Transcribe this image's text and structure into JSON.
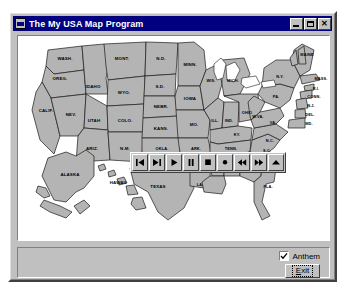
{
  "window": {
    "title": "The My USA Map Program",
    "icon": "application-window-icon",
    "controls": [
      {
        "name": "minimize",
        "glyph": "_"
      },
      {
        "name": "maximize",
        "glyph": "□"
      },
      {
        "name": "close",
        "glyph": "✕"
      }
    ]
  },
  "map": {
    "name": "usa-map",
    "states": [
      {
        "abbr": "WASH.",
        "x": 47,
        "y": 24
      },
      {
        "abbr": "OREG.",
        "x": 42,
        "y": 42
      },
      {
        "abbr": "CALIF.",
        "x": 30,
        "y": 75
      },
      {
        "abbr": "NEV.",
        "x": 53,
        "y": 72
      },
      {
        "abbr": "IDAHO",
        "x": 70,
        "y": 42
      },
      {
        "abbr": "MONT.",
        "x": 100,
        "y": 27
      },
      {
        "abbr": "WYO.",
        "x": 100,
        "y": 56
      },
      {
        "abbr": "UTAH",
        "x": 75,
        "y": 78
      },
      {
        "abbr": "COLO.",
        "x": 108,
        "y": 82
      },
      {
        "abbr": "ARIZ.",
        "x": 72,
        "y": 108
      },
      {
        "abbr": "N.M.",
        "x": 104,
        "y": 112
      },
      {
        "abbr": "N.D.",
        "x": 137,
        "y": 27
      },
      {
        "abbr": "S.D.",
        "x": 137,
        "y": 48
      },
      {
        "abbr": "NEBR.",
        "x": 140,
        "y": 70
      },
      {
        "abbr": "KANS.",
        "x": 146,
        "y": 92
      },
      {
        "abbr": "OKLA.",
        "x": 146,
        "y": 113
      },
      {
        "abbr": "TEXAS",
        "x": 137,
        "y": 150
      },
      {
        "abbr": "MINN.",
        "x": 168,
        "y": 32
      },
      {
        "abbr": "IOWA",
        "x": 170,
        "y": 63
      },
      {
        "abbr": "MO.",
        "x": 180,
        "y": 88
      },
      {
        "abbr": "ARK.",
        "x": 178,
        "y": 115
      },
      {
        "abbr": "LA.",
        "x": 180,
        "y": 140
      },
      {
        "abbr": "WIS.",
        "x": 190,
        "y": 43
      },
      {
        "abbr": "ILL.",
        "x": 196,
        "y": 77
      },
      {
        "abbr": "MICH.",
        "x": 214,
        "y": 45
      },
      {
        "abbr": "IND.",
        "x": 212,
        "y": 77
      },
      {
        "abbr": "OHIO",
        "x": 231,
        "y": 72
      },
      {
        "abbr": "KY.",
        "x": 223,
        "y": 94
      },
      {
        "abbr": "TENN.",
        "x": 215,
        "y": 108
      },
      {
        "abbr": "MISS.",
        "x": 197,
        "y": 129
      },
      {
        "abbr": "ALA.",
        "x": 213,
        "y": 129
      },
      {
        "abbr": "GA.",
        "x": 236,
        "y": 131
      },
      {
        "abbr": "FLA.",
        "x": 251,
        "y": 159
      },
      {
        "abbr": "S.C.",
        "x": 250,
        "y": 117
      },
      {
        "abbr": "N.C.",
        "x": 255,
        "y": 104
      },
      {
        "abbr": "VA.",
        "x": 256,
        "y": 87
      },
      {
        "abbr": "W.VA.",
        "x": 242,
        "y": 83
      },
      {
        "abbr": "PA.",
        "x": 258,
        "y": 60
      },
      {
        "abbr": "N.Y.",
        "x": 265,
        "y": 42
      },
      {
        "abbr": "MAINE",
        "x": 292,
        "y": 18
      },
      {
        "abbr": "VT.",
        "x": 277,
        "y": 29
      },
      {
        "abbr": "N.H.",
        "x": 284,
        "y": 32
      },
      {
        "abbr": "MASS.",
        "x": 296,
        "y": 44
      },
      {
        "abbr": "R.I.",
        "x": 295,
        "y": 54
      },
      {
        "abbr": "CONN.",
        "x": 292,
        "y": 62
      },
      {
        "abbr": "N.J.",
        "x": 292,
        "y": 70
      },
      {
        "abbr": "DEL.",
        "x": 292,
        "y": 78
      },
      {
        "abbr": "MD.",
        "x": 292,
        "y": 86
      },
      {
        "abbr": "ALASKA",
        "x": 53,
        "y": 143
      },
      {
        "abbr": "HAWAII",
        "x": 102,
        "y": 150
      }
    ]
  },
  "media_toolbar": {
    "name": "media-playback-toolbar",
    "buttons": [
      {
        "name": "skip-to-start-button",
        "icon": "skip-to-start-icon"
      },
      {
        "name": "skip-to-end-button",
        "icon": "skip-to-end-icon"
      },
      {
        "name": "play-button",
        "icon": "play-icon"
      },
      {
        "name": "pause-button",
        "icon": "pause-icon"
      },
      {
        "name": "stop-button",
        "icon": "stop-icon"
      },
      {
        "name": "record-button",
        "icon": "record-icon"
      },
      {
        "name": "rewind-button",
        "icon": "rewind-icon"
      },
      {
        "name": "fast-forward-button",
        "icon": "fast-forward-icon"
      },
      {
        "name": "eject-button",
        "icon": "eject-icon"
      }
    ]
  },
  "bottom_panel": {
    "anthem": {
      "label": "Anthem",
      "checked": true
    },
    "exit": {
      "label_prefix": "E",
      "label_rest": "xit"
    }
  },
  "colors": {
    "titlebar": "#000080",
    "face": "#c0c0c0",
    "state_fill": "#b4b4b4",
    "outline": "#1a1a1a",
    "water": "#ffffff"
  }
}
